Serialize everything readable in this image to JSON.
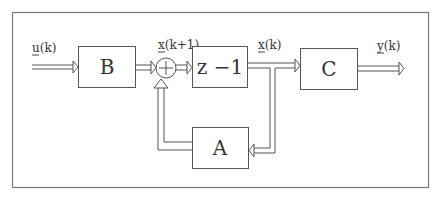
{
  "diagram": {
    "type": "block-diagram",
    "blocks": [
      {
        "id": "B",
        "label": "B"
      },
      {
        "id": "delay",
        "label": "z −1"
      },
      {
        "id": "C",
        "label": "C"
      },
      {
        "id": "A",
        "label": "A"
      }
    ],
    "signals": {
      "input": {
        "base": "u",
        "arg": "(k)"
      },
      "next_state": {
        "base": "x",
        "arg": "(k+1)"
      },
      "state": {
        "base": "x",
        "arg": "(k)"
      },
      "output": {
        "base": "y",
        "arg": "(k)"
      }
    },
    "summing_junction": {
      "symbol": "+"
    },
    "connections": [
      "u(k) -> B",
      "B -> sum",
      "sum -> z-1 (x(k+1))",
      "z-1 -> C (x(k))",
      "x(k) -> A",
      "A -> sum",
      "C -> y(k)"
    ],
    "colors": {
      "stroke": "#555555",
      "text": "#333333",
      "background": "#ffffff"
    }
  }
}
